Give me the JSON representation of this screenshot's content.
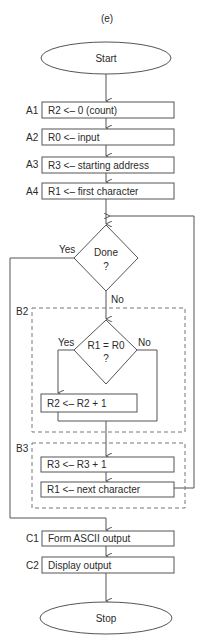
{
  "figure_label": "(e)",
  "terminals": {
    "start": "Start",
    "stop": "Stop"
  },
  "steps": [
    {
      "id": "A1",
      "text": "R2 <– 0 (count)"
    },
    {
      "id": "A2",
      "text": "R0 <– input"
    },
    {
      "id": "A3",
      "text": "R3 <– starting address"
    },
    {
      "id": "A4",
      "text": "R1 <– first character"
    }
  ],
  "decision_done": {
    "line1": "Done",
    "line2": "?",
    "yes": "Yes",
    "no": "No"
  },
  "group_b2": {
    "label": "B2",
    "decision": {
      "line1": "R1 = R0",
      "line2": "?",
      "yes": "Yes",
      "no": "No"
    },
    "step": "R2 <– R2 + 1"
  },
  "group_b3": {
    "label": "B3",
    "steps": [
      "R3 <– R3 + 1",
      "R1 <– next character"
    ]
  },
  "output_steps": [
    {
      "id": "C1",
      "text": "Form ASCII output"
    },
    {
      "id": "C2",
      "text": "Display output"
    }
  ]
}
